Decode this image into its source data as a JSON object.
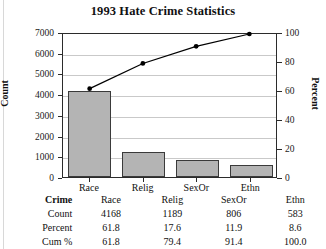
{
  "chart_data": {
    "type": "bar",
    "title": "1993 Hate Crime Statistics",
    "categories": [
      "Race",
      "Relig",
      "SexOr",
      "Ethn"
    ],
    "values": [
      4168,
      1189,
      806,
      583
    ],
    "series": [
      {
        "name": "Count",
        "values": [
          4168,
          1189,
          806,
          583
        ],
        "axis": "left"
      },
      {
        "name": "Cum %",
        "values": [
          61.8,
          79.4,
          91.4,
          100.0
        ],
        "axis": "right"
      }
    ],
    "percent": [
      61.8,
      17.6,
      11.9,
      8.6
    ],
    "xlabel": "Crime",
    "ylabel": "Count",
    "y2label": "Percent",
    "ylim": [
      0,
      7000
    ],
    "y2lim": [
      0,
      100
    ],
    "yticks": [
      0,
      1000,
      2000,
      3000,
      4000,
      5000,
      6000,
      7000
    ],
    "y2ticks": [
      0,
      20,
      40,
      60,
      80,
      100
    ],
    "grid": true,
    "legend": "none",
    "bar_color": "#b4b4b4",
    "line_color": "#000000"
  },
  "axes": {
    "left_title": "Count",
    "right_title": "Percent",
    "left_ticks": [
      "7000",
      "6000",
      "5000",
      "4000",
      "3000",
      "2000",
      "1000",
      "0"
    ],
    "right_ticks": [
      "100",
      "80",
      "60",
      "40",
      "20",
      "0"
    ],
    "categories": [
      "Race",
      "Relig",
      "SexOr",
      "Ethn"
    ]
  },
  "table": {
    "header": {
      "label": "Crime",
      "cells": [
        "Race",
        "Relig",
        "SexOr",
        "Ethn"
      ]
    },
    "rows": [
      {
        "label": "Count",
        "cells": [
          "4168",
          "1189",
          "806",
          "583"
        ]
      },
      {
        "label": "Percent",
        "cells": [
          "61.8",
          "17.6",
          "11.9",
          "8.6"
        ]
      },
      {
        "label": "Cum %",
        "cells": [
          "61.8",
          "79.4",
          "91.4",
          "100.0"
        ]
      }
    ]
  }
}
